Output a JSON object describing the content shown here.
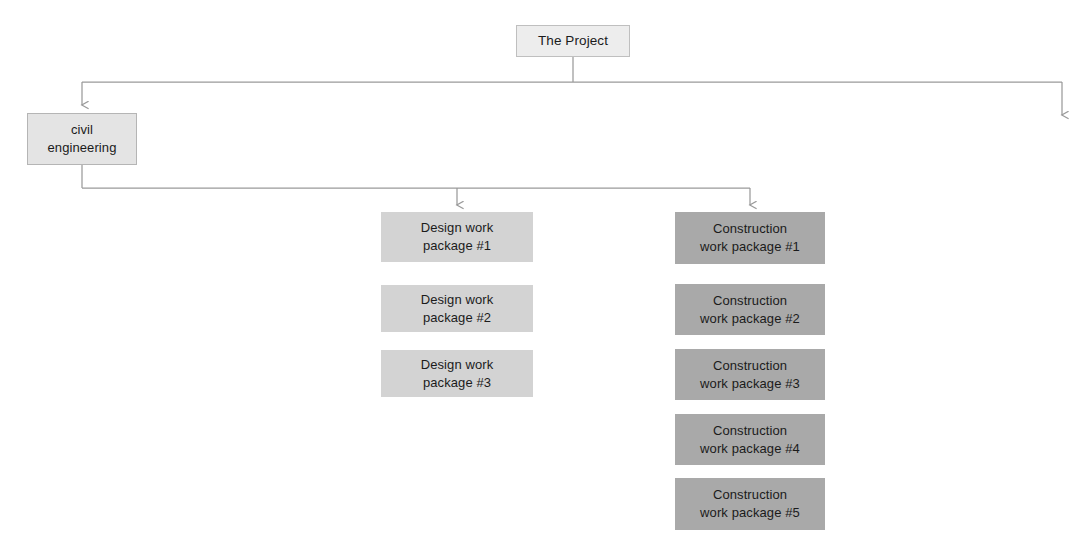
{
  "diagram": {
    "colors": {
      "root_fill": "#ededed",
      "root_stroke": "#bfbfbf",
      "level1_fill": "#e4e4e4",
      "level1_stroke": "#b5b5b5",
      "design_fill": "#d3d3d3",
      "construction_fill": "#a9a9a9",
      "connector": "#9a9a9a",
      "text": "#1b1b1b",
      "background": "#ffffff"
    },
    "root": {
      "label": "The Project"
    },
    "level1": [
      {
        "label": "civil\nengineering"
      }
    ],
    "columns": [
      {
        "name": "design",
        "items": [
          {
            "label": "Design work\npackage #1"
          },
          {
            "label": "Design work\npackage #2"
          },
          {
            "label": "Design work\npackage #3"
          }
        ]
      },
      {
        "name": "construction",
        "items": [
          {
            "label": "Construction\nwork package #1"
          },
          {
            "label": "Construction\nwork package #2"
          },
          {
            "label": "Construction\nwork package #3"
          },
          {
            "label": "Construction\nwork package #4"
          },
          {
            "label": "Construction\nwork package #5"
          }
        ]
      }
    ]
  }
}
